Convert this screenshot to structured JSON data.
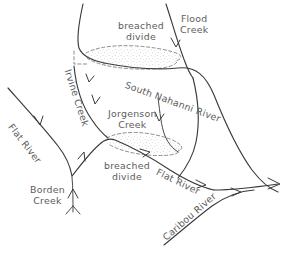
{
  "map": {
    "title": "Drainage network sketch: breached divides, Flat River / South Nahanni River area",
    "type": "hand-drawn-hydrology-sketch",
    "background_color": "#ffffff",
    "ink_color": "#3a3a3a",
    "label_color": "#5c5c5c",
    "divide_color": "#7a7a7a",
    "width": 287,
    "height": 254
  },
  "labels": {
    "flood_creek": {
      "line1": "Flood",
      "line2": "Creek"
    },
    "breached_divide_upper": {
      "line1": "breached",
      "line2": "divide"
    },
    "breached_divide_lower": {
      "line1": "breached",
      "line2": "divide"
    },
    "south_nahanni_river": {
      "text": "South Nahanni River"
    },
    "irvine_creek": {
      "text": "Irvine Creek"
    },
    "jorgenson_creek": {
      "line1": "Jorgenson",
      "line2": "Creek"
    },
    "flat_river_left": {
      "text": "Flat River"
    },
    "flat_river_lower": {
      "text": "Flat River"
    },
    "borden_creek": {
      "line1": "Borden",
      "line2": "Creek"
    },
    "caribou_river": {
      "text": "Caribou River"
    }
  },
  "features": {
    "rivers": [
      {
        "name": "South Nahanni River",
        "flow": "southeast"
      },
      {
        "name": "Flat River",
        "flow": "southeast"
      },
      {
        "name": "Caribou River",
        "flow": "northeast"
      }
    ],
    "creeks": [
      {
        "name": "Flood Creek",
        "flow": "south"
      },
      {
        "name": "Irvine Creek",
        "flow": "south"
      },
      {
        "name": "Jorgenson Creek",
        "flow": "south"
      },
      {
        "name": "Borden Creek",
        "flow": "north"
      }
    ],
    "breached_divides": [
      {
        "id": "upper",
        "between": "Irvine Creek / South Nahanni River"
      },
      {
        "id": "lower",
        "between": "Jorgenson Creek / Flat River"
      }
    ]
  }
}
